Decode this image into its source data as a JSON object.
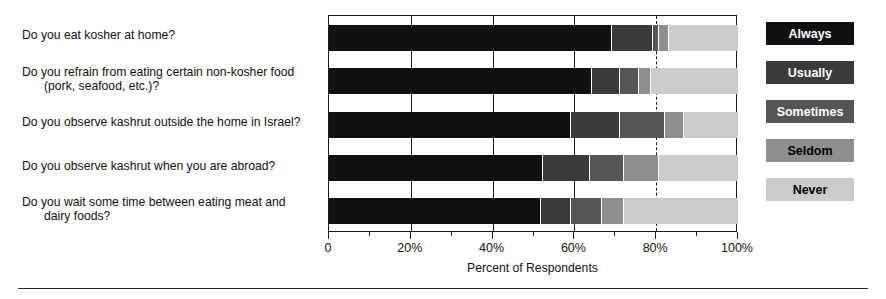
{
  "chart_data": {
    "type": "bar",
    "orientation": "horizontal",
    "stacked": true,
    "normalized": "percent",
    "title": "",
    "xlabel": "Percent of Respondents",
    "ylabel": "",
    "xlim": [
      0,
      100
    ],
    "xticks": [
      0,
      20,
      40,
      60,
      80,
      100
    ],
    "xticklabels": [
      "0",
      "20%",
      "40%",
      "60%",
      "80%",
      "100%"
    ],
    "minor_xticks": [
      10,
      30,
      50,
      70,
      90
    ],
    "grid": "vertical gridlines at 20%, 40%, 60%; dashed gridline at 80%",
    "legend_position": "right",
    "categories": [
      "Do you eat kosher at home?",
      "Do you refrain from eating certain non-kosher food (pork, seafood, etc.)?",
      "Do you observe kashrut outside the home  in Israel?",
      "Do you observe kashrut when you are abroad?",
      "Do you wait some time between eating meat and dairy foods?"
    ],
    "series": [
      {
        "name": "Always",
        "color": "#111111",
        "values": [
          69.0,
          64.0,
          59.0,
          52.0,
          51.5
        ]
      },
      {
        "name": "Usually",
        "color": "#3a3a3a",
        "values": [
          10.0,
          7.0,
          12.0,
          11.5,
          7.5
        ]
      },
      {
        "name": "Sometimes",
        "color": "#555555",
        "values": [
          1.5,
          4.5,
          11.0,
          8.5,
          7.5
        ]
      },
      {
        "name": "Seldom",
        "color": "#8e8e8e",
        "values": [
          2.5,
          3.0,
          4.5,
          8.5,
          5.5
        ]
      },
      {
        "name": "Never",
        "color": "#cccccc",
        "values": [
          17.0,
          21.5,
          13.5,
          19.5,
          28.0
        ]
      }
    ]
  },
  "questions": [
    {
      "line1": "Do you eat kosher at home?",
      "line2": ""
    },
    {
      "line1": "Do you refrain from eating certain non-kosher food",
      "line2": "(pork, seafood, etc.)?"
    },
    {
      "line1": "Do you observe kashrut outside the home  in Israel?",
      "line2": ""
    },
    {
      "line1": "Do you observe kashrut when you are abroad?",
      "line2": ""
    },
    {
      "line1": "Do you wait some time between eating meat and",
      "line2": "dairy foods?"
    }
  ],
  "axis": {
    "title": "Percent of Respondents",
    "ticklabels": [
      "0",
      "20%",
      "40%",
      "60%",
      "80%",
      "100%"
    ]
  },
  "legend": {
    "items": [
      {
        "label": "Always",
        "color": "#111111"
      },
      {
        "label": "Usually",
        "color": "#3a3a3a"
      },
      {
        "label": "Sometimes",
        "color": "#555555"
      },
      {
        "label": "Seldom",
        "color": "#8e8e8e"
      },
      {
        "label": "Never",
        "color": "#cccccc"
      }
    ]
  }
}
